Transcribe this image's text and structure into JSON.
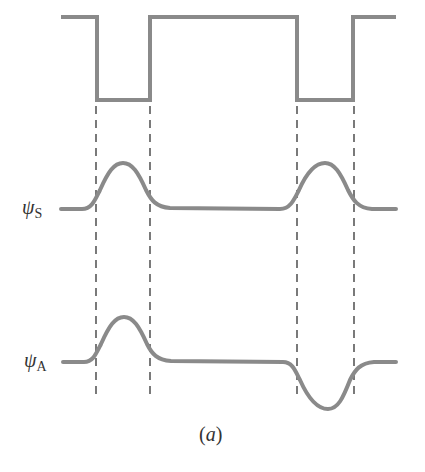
{
  "diagram": {
    "labels": {
      "psi_s_symbol": "ψ",
      "psi_s_sub": "S",
      "psi_a_symbol": "ψ",
      "psi_a_sub": "A",
      "caption": "(a)"
    },
    "colors": {
      "curve": "#8a8a8a",
      "dash": "#333333",
      "text": "#333333"
    },
    "square_wave": {
      "high_y": 17,
      "low_y": 100,
      "x_start": 61,
      "x_end": 396,
      "transitions_x": [
        97,
        150,
        297,
        353
      ]
    },
    "psi_s": {
      "baseline_y": 209,
      "peaks": [
        {
          "x": 123,
          "y": 163
        },
        {
          "x": 325,
          "y": 163
        }
      ]
    },
    "psi_a": {
      "baseline_y": 362,
      "peak": {
        "x": 124,
        "y": 317
      },
      "trough": {
        "x": 328,
        "y": 409
      }
    }
  }
}
